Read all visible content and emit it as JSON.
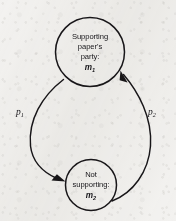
{
  "figure": {
    "kind": "state-transition-diagram",
    "background_color": "#f3f2f0",
    "ink_color": "#181619",
    "width": 176,
    "height": 221
  },
  "nodes": [
    {
      "id": "state-supporting",
      "position": "top",
      "cx": 90,
      "cy": 52,
      "r": 35,
      "lines": [
        "Supporting",
        "paper's",
        "party:"
      ],
      "symbol": "m",
      "symbol_subscript": "1"
    },
    {
      "id": "state-not-supporting",
      "position": "bottom",
      "cx": 91,
      "cy": 185,
      "r": 26,
      "lines": [
        "Not",
        "supporting:"
      ],
      "symbol": "m",
      "symbol_subscript": "2"
    }
  ],
  "edges": [
    {
      "id": "edge-supporting-to-not-supporting",
      "side": "left",
      "direction": "top-to-bottom",
      "label": "p",
      "label_subscript": "1",
      "label_x": 20,
      "label_y": 115
    },
    {
      "id": "edge-not-supporting-to-supporting",
      "side": "right",
      "direction": "bottom-to-top",
      "label": "p",
      "label_subscript": "2",
      "label_y": 115,
      "label_x": 152
    }
  ]
}
